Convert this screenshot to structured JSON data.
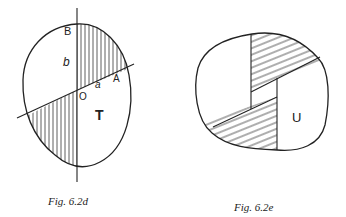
{
  "figures": [
    {
      "id": "fig-6.2d",
      "caption": "Fig.  6.2d",
      "labels": {
        "B": "B",
        "b": "b",
        "A": "A",
        "a": "a",
        "O": "O",
        "T": "T"
      }
    },
    {
      "id": "fig-6.2e",
      "caption": "Fig.  6.2e",
      "labels": {
        "U": "U"
      }
    }
  ]
}
